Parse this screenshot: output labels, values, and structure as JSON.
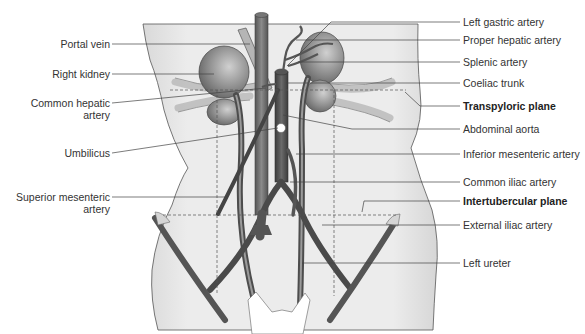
{
  "figure": {
    "colors": {
      "background": "#ffffff",
      "torso_fill": "#e9e9e9",
      "vessel_dark": "#5a5a5a",
      "kidney": "#8a8a8a",
      "leader_line": "#444444",
      "label_text": "#333333"
    }
  },
  "labels_left": [
    {
      "id": "portal-vein",
      "text": "Portal vein"
    },
    {
      "id": "right-kidney",
      "text": "Right kidney"
    },
    {
      "id": "common-hepatic-artery",
      "line1": "Common hepatic",
      "line2": "artery"
    },
    {
      "id": "umbilicus",
      "text": "Umbilicus"
    },
    {
      "id": "superior-mesenteric-artery",
      "line1": "Superior mesenteric",
      "line2": "artery"
    }
  ],
  "labels_right": [
    {
      "id": "left-gastric-artery",
      "text": "Left gastric artery",
      "bold": false
    },
    {
      "id": "proper-hepatic-artery",
      "text": "Proper hepatic artery",
      "bold": false
    },
    {
      "id": "splenic-artery",
      "text": "Splenic artery",
      "bold": false
    },
    {
      "id": "coeliac-trunk",
      "text": "Coeliac trunk",
      "bold": false
    },
    {
      "id": "transpyloric-plane",
      "text": "Transpyloric plane",
      "bold": true
    },
    {
      "id": "abdominal-aorta",
      "text": "Abdominal aorta",
      "bold": false
    },
    {
      "id": "inferior-mesenteric-artery",
      "text": "Inferior mesenteric artery",
      "bold": false
    },
    {
      "id": "common-iliac-artery",
      "text": "Common iliac artery",
      "bold": false
    },
    {
      "id": "intertubercular-plane",
      "text": "Intertubercular plane",
      "bold": true
    },
    {
      "id": "external-iliac-artery",
      "text": "External iliac artery",
      "bold": false
    },
    {
      "id": "left-ureter",
      "text": "Left ureter",
      "bold": false
    }
  ]
}
